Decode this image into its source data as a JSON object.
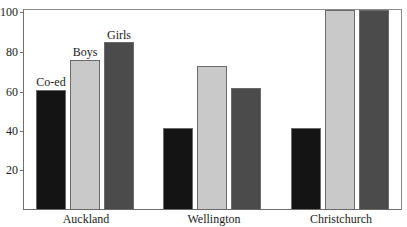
{
  "chart_data": {
    "type": "bar",
    "title": "",
    "xlabel": "",
    "ylabel": "",
    "ylim": [
      0,
      100
    ],
    "yticks": [
      20,
      40,
      60,
      80,
      100
    ],
    "grid": false,
    "legend_position": "inline-labels-above-first-group",
    "categories": [
      "Auckland",
      "Wellington",
      "Christchurch"
    ],
    "series": [
      {
        "name": "Co-ed",
        "color": "#141414",
        "values": [
          60,
          41,
          41
        ]
      },
      {
        "name": "Boys",
        "color": "#c9c9c9",
        "values": [
          75,
          72,
          100
        ]
      },
      {
        "name": "Girls",
        "color": "#4b4b4b",
        "values": [
          84,
          61,
          100
        ]
      }
    ]
  },
  "ytick_labels": [
    "20",
    "40",
    "60",
    "80",
    "100"
  ],
  "series_labels": [
    "Co-ed",
    "Boys",
    "Girls"
  ],
  "category_labels": [
    "Auckland",
    "Wellington",
    "Christchurch"
  ]
}
